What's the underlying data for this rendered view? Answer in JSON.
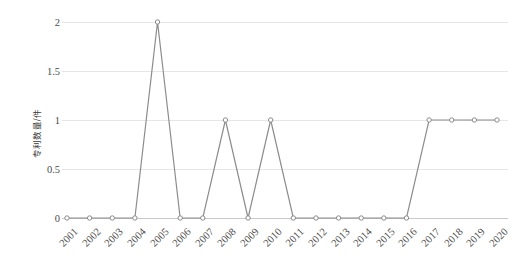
{
  "chart_data": {
    "type": "line",
    "title": "",
    "xlabel": "",
    "ylabel": "专利数量/件",
    "categories": [
      "2001",
      "2002",
      "2003",
      "2004",
      "2005",
      "2006",
      "2007",
      "2008",
      "2009",
      "2010",
      "2011",
      "2012",
      "2013",
      "2014",
      "2015",
      "2016",
      "2017",
      "2018",
      "2019",
      "2020"
    ],
    "values": [
      0,
      0,
      0,
      0,
      2,
      0,
      0,
      1,
      0,
      1,
      0,
      0,
      0,
      0,
      0,
      0,
      1,
      1,
      1,
      1
    ],
    "series": [
      {
        "name": "专利数量",
        "values": [
          0,
          0,
          0,
          0,
          2,
          0,
          0,
          1,
          0,
          1,
          0,
          0,
          0,
          0,
          0,
          0,
          1,
          1,
          1,
          1
        ]
      }
    ],
    "ylim": [
      0,
      2
    ],
    "yticks": [
      0,
      0.5,
      1,
      1.5,
      2
    ],
    "ytick_labels": [
      "0",
      "0.5",
      "1",
      "1.5",
      "2"
    ],
    "grid": true,
    "grid_axis": "y",
    "legend": false,
    "legend_position": "none",
    "marker": "circle-open",
    "line_color": "#8c8c8c",
    "marker_edge_color": "#8c8c8c",
    "marker_face_color": "#ffffff",
    "grid_color": "#e6e6e6",
    "text_color": "#4a4a4a",
    "background_color": "#ffffff"
  },
  "axes": {
    "y_title": "专利数量/件",
    "y_tick_labels": [
      "2",
      "1.5",
      "1",
      "0.5",
      "0"
    ],
    "x_tick_labels": [
      "2001",
      "2002",
      "2003",
      "2004",
      "2005",
      "2006",
      "2007",
      "2008",
      "2009",
      "2010",
      "2011",
      "2012",
      "2013",
      "2014",
      "2015",
      "2016",
      "2017",
      "2018",
      "2019",
      "2020"
    ]
  }
}
